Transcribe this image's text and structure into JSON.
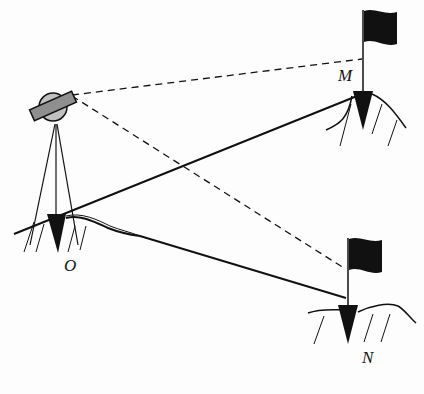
{
  "diagram": {
    "points": {
      "O": {
        "label": "O"
      },
      "M": {
        "label": "M"
      },
      "N": {
        "label": "N"
      }
    },
    "colors": {
      "line": "#111111",
      "instrument_fill": "#a8a8a8",
      "background": "#fdfdfd"
    }
  }
}
